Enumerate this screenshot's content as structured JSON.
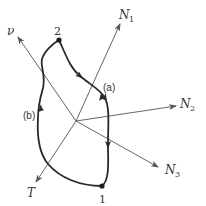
{
  "diagram": {
    "type": "phase-space / coordinate-axes diagram with closed process path",
    "origin": {
      "x": 76,
      "y": 121
    },
    "axes": [
      {
        "id": "N1",
        "symbol": "N",
        "subscript": "1",
        "direction": "up-right"
      },
      {
        "id": "N2",
        "symbol": "N",
        "subscript": "2",
        "direction": "right"
      },
      {
        "id": "N3",
        "symbol": "N",
        "subscript": "3",
        "direction": "down-right"
      },
      {
        "id": "T",
        "symbol": "T",
        "subscript": "",
        "direction": "down-left"
      },
      {
        "id": "V",
        "symbol": "ν",
        "subscript": "",
        "direction": "up-left"
      }
    ],
    "points": [
      {
        "id": "1",
        "label": "1"
      },
      {
        "id": "2",
        "label": "2"
      }
    ],
    "paths": [
      {
        "id": "a",
        "label": "(a)",
        "from": "2",
        "to": "1",
        "side": "right"
      },
      {
        "id": "b",
        "label": "(b)",
        "from": "1",
        "to": "2",
        "side": "left"
      }
    ],
    "colors": {
      "axis": "#555555",
      "curve": "#2a2a2a",
      "text": "#333333",
      "background": "#ffffff"
    }
  }
}
